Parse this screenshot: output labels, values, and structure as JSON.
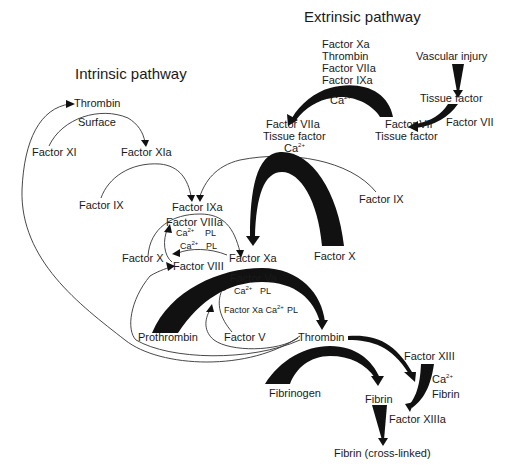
{
  "titles": {
    "extrinsic": "Extrinsic pathway",
    "intrinsic": "Intrinsic pathway"
  },
  "extrinsic": {
    "cofactors": [
      "Factor Xa",
      "Thrombin",
      "Factor VIIa",
      "Factor IXa"
    ],
    "ca": "Ca",
    "ca_sup": "2+",
    "vascular_injury": "Vascular injury",
    "tissue_factor": "Tissue factor",
    "factor_vii_input": "Factor VII",
    "complex_vii_line1": "Factor VII",
    "complex_vii_line2": "Tissue factor",
    "complex_viia_line1": "Factor VIIa",
    "complex_viia_line2": "Tissue factor",
    "complex_viia_ca": "Ca",
    "complex_viia_ca_sup": "2+"
  },
  "intrinsic": {
    "thrombin_top": "Thrombin",
    "surface": "Surface",
    "factor_xi": "Factor XI",
    "factor_xia": "Factor XIa",
    "factor_ix_left": "Factor IX",
    "factor_ixa": "Factor IXa",
    "factor_ix_right": "Factor IX",
    "factor_viiia": "Factor VIIIa",
    "viiia_ca": "Ca",
    "viiia_ca_sup": "2+",
    "viiia_pl": "PL",
    "mid_ca": "Ca",
    "mid_ca_sup": "2+",
    "mid_pl": "PL",
    "factor_x_left": "Factor X",
    "factor_viii": "Factor VIII",
    "factor_xa": "Factor Xa",
    "factor_x_right": "Factor X"
  },
  "common": {
    "factor_va": "Factor Va",
    "va_ca": "Ca",
    "va_ca_sup": "2+",
    "va_pl": "PL",
    "xa_ca_pl_prefix": "Factor Xa Ca",
    "xa_ca_pl_sup": "2+",
    "xa_ca_pl_suffix": "PL",
    "prothrombin": "Prothrombin",
    "factor_v": "Factor V",
    "thrombin": "Thrombin",
    "fibrinogen": "Fibrinogen",
    "fibrin": "Fibrin",
    "factor_xiii": "Factor XIII",
    "xiii_ca": "Ca",
    "xiii_ca_sup": "2+",
    "xiii_fibrin": "Fibrin",
    "factor_xiiia": "Factor XIIIa",
    "fibrin_crosslinked": "Fibrin (cross-linked)"
  }
}
